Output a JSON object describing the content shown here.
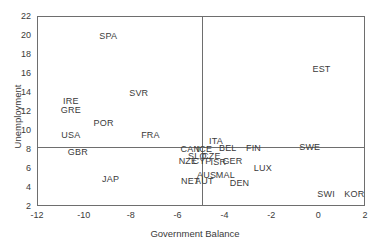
{
  "chart_data": {
    "type": "scatter",
    "title": "",
    "xlabel": "Government Balance",
    "ylabel": "Unemployment",
    "xlim": [
      -12,
      2
    ],
    "ylim": [
      2,
      22
    ],
    "xticks": [
      -12,
      -10,
      -8,
      -6,
      -4,
      -2,
      0,
      2
    ],
    "yticks": [
      2,
      4,
      6,
      8,
      10,
      12,
      14,
      16,
      18,
      20,
      22
    ],
    "grid": false,
    "legend": "none",
    "marker_style": "text-labels-only",
    "reference_lines": [
      {
        "axis": "x",
        "value": -5.0
      },
      {
        "axis": "y",
        "value": 8.3
      }
    ],
    "points": [
      {
        "label": "SPA",
        "x": -9.0,
        "y": 20.0
      },
      {
        "label": "EST",
        "x": 0.1,
        "y": 16.5
      },
      {
        "label": "SVR",
        "x": -7.7,
        "y": 14.0
      },
      {
        "label": "IRE",
        "x": -10.6,
        "y": 13.2
      },
      {
        "label": "GRE",
        "x": -10.6,
        "y": 12.2
      },
      {
        "label": "POR",
        "x": -9.2,
        "y": 10.8
      },
      {
        "label": "USA",
        "x": -10.6,
        "y": 9.6
      },
      {
        "label": "FRA",
        "x": -7.2,
        "y": 9.6
      },
      {
        "label": "ITA",
        "x": -4.4,
        "y": 9.0
      },
      {
        "label": "GBR",
        "x": -10.3,
        "y": 7.8
      },
      {
        "label": "CAN",
        "x": -5.5,
        "y": 8.1
      },
      {
        "label": "ICE",
        "x": -4.9,
        "y": 8.1
      },
      {
        "label": "BEL",
        "x": -3.9,
        "y": 8.2
      },
      {
        "label": "FIN",
        "x": -2.8,
        "y": 8.2
      },
      {
        "label": "SWE",
        "x": -0.4,
        "y": 8.3
      },
      {
        "label": "SLO",
        "x": -5.2,
        "y": 7.4
      },
      {
        "label": "CZE",
        "x": -4.6,
        "y": 7.4
      },
      {
        "label": "NZE",
        "x": -5.6,
        "y": 6.8
      },
      {
        "label": "CYP",
        "x": -5.0,
        "y": 6.8
      },
      {
        "label": "ISR",
        "x": -4.3,
        "y": 6.7
      },
      {
        "label": "GER",
        "x": -3.7,
        "y": 6.8
      },
      {
        "label": "LUX",
        "x": -2.4,
        "y": 6.1
      },
      {
        "label": "JAP",
        "x": -8.9,
        "y": 5.0
      },
      {
        "label": "AUS",
        "x": -4.8,
        "y": 5.4
      },
      {
        "label": "MAL",
        "x": -4.0,
        "y": 5.4
      },
      {
        "label": "NET",
        "x": -5.5,
        "y": 4.7
      },
      {
        "label": "AUT",
        "x": -4.9,
        "y": 4.7
      },
      {
        "label": "DEN",
        "x": -3.4,
        "y": 4.5
      },
      {
        "label": "SWI",
        "x": 0.3,
        "y": 3.4
      },
      {
        "label": "KOR",
        "x": 1.5,
        "y": 3.4
      }
    ]
  }
}
